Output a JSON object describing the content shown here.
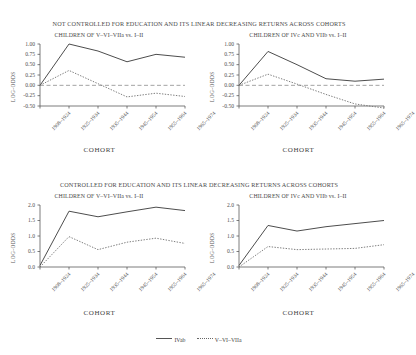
{
  "figure": {
    "panels": [
      {
        "id": "not-controlled",
        "title": "NOT CONTROLLED FOR EDUCATION AND ITS LINEAR DECREASING RETURNS ACROSS COHORTS"
      },
      {
        "id": "controlled",
        "title": "CONTROLLED FOR EDUCATION AND ITS LINEAR DECREASING RETURNS ACROSS COHORTS"
      }
    ],
    "legend": {
      "position": "bottom-center",
      "entries": [
        {
          "label": "IVab",
          "style": "solid"
        },
        {
          "label": "V–VI–VIIa",
          "style": "dotted"
        }
      ]
    }
  },
  "chart_data": [
    {
      "id": "top-left",
      "type": "line",
      "title": "CHILDREN OF V–VI–VIIa vs. I–II",
      "xlabel": "COHORT",
      "ylabel": "LOG-ODDS",
      "categories": [
        "1908–1924",
        "1925–1934",
        "1935–1944",
        "1945–1954",
        "1955–1964",
        "1965–1974"
      ],
      "ylim": [
        -0.5,
        1.0
      ],
      "yticks": [
        "1.00",
        "0.75",
        "0.50",
        "0.25",
        "0.00",
        "-0.25",
        "-0.50"
      ],
      "ytickvals": [
        1.0,
        0.75,
        0.5,
        0.25,
        0.0,
        -0.25,
        -0.5
      ],
      "grid": false,
      "zero_reference_line": 0.0,
      "series": [
        {
          "name": "IVab",
          "style": "solid",
          "values": [
            0.0,
            1.0,
            0.83,
            0.57,
            0.75,
            0.68
          ]
        },
        {
          "name": "V–VI–VIIa",
          "style": "dotted",
          "values": [
            0.0,
            0.36,
            0.04,
            -0.28,
            -0.19,
            -0.27
          ]
        }
      ]
    },
    {
      "id": "top-right",
      "type": "line",
      "title": "CHILDREN OF IVc AND VIIb vs. I–II",
      "xlabel": "COHORT",
      "ylabel": "LOG-ODDS",
      "categories": [
        "1908–1924",
        "1925–1934",
        "1935–1944",
        "1945–1954",
        "1955–1964",
        "1965–1974"
      ],
      "ylim": [
        -0.5,
        1.0
      ],
      "yticks": [
        "1.00",
        "0.75",
        "0.50",
        "0.25",
        "0.00",
        "-0.25",
        "-0.50"
      ],
      "ytickvals": [
        1.0,
        0.75,
        0.5,
        0.25,
        0.0,
        -0.25,
        -0.5
      ],
      "grid": false,
      "zero_reference_line": 0.0,
      "series": [
        {
          "name": "IVab",
          "style": "solid",
          "values": [
            0.0,
            0.82,
            0.5,
            0.16,
            0.1,
            0.15
          ]
        },
        {
          "name": "V–VI–VIIa",
          "style": "dotted",
          "values": [
            0.0,
            0.27,
            0.03,
            -0.22,
            -0.45,
            -0.55
          ]
        }
      ]
    },
    {
      "id": "bottom-left",
      "type": "line",
      "title": "CHILDREN OF V–VI–VIIa vs. I–II",
      "xlabel": "COHORT",
      "ylabel": "LOG-ODDS",
      "categories": [
        "1908–1924",
        "1925–1934",
        "1935–1944",
        "1945–1954",
        "1955–1964",
        "1965–1974"
      ],
      "ylim": [
        0.0,
        2.0
      ],
      "yticks": [
        "2.0",
        "1.5",
        "1.0",
        "0.5",
        "0.0"
      ],
      "ytickvals": [
        2.0,
        1.5,
        1.0,
        0.5,
        0.0
      ],
      "grid": false,
      "series": [
        {
          "name": "IVab",
          "style": "solid",
          "values": [
            0.05,
            1.8,
            1.62,
            1.78,
            1.93,
            1.82
          ]
        },
        {
          "name": "V–VI–VIIa",
          "style": "dotted",
          "values": [
            0.0,
            0.98,
            0.56,
            0.8,
            0.93,
            0.76
          ]
        }
      ]
    },
    {
      "id": "bottom-right",
      "type": "line",
      "title": "CHILDREN OF IVc AND VIIb vs. I–II",
      "xlabel": "COHORT",
      "ylabel": "LOG-ODDS",
      "categories": [
        "1908–1924",
        "1925–1934",
        "1935–1944",
        "1945–1954",
        "1955–1964",
        "1965–1974"
      ],
      "ylim": [
        0.0,
        2.0
      ],
      "yticks": [
        "2.0",
        "1.5",
        "1.0",
        "0.5",
        "0.0"
      ],
      "ytickvals": [
        2.0,
        1.5,
        1.0,
        0.5,
        0.0
      ],
      "grid": false,
      "series": [
        {
          "name": "IVab",
          "style": "solid",
          "values": [
            0.05,
            1.34,
            1.16,
            1.3,
            1.4,
            1.5
          ]
        },
        {
          "name": "V–VI–VIIa",
          "style": "dotted",
          "values": [
            0.0,
            0.66,
            0.56,
            0.58,
            0.6,
            0.72
          ]
        }
      ]
    }
  ]
}
